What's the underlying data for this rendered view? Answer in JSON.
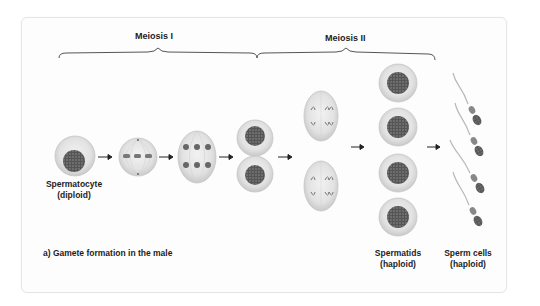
{
  "diagram": {
    "title": "a) Gamete formation in the male",
    "phases": [
      {
        "label": "Meiosis I"
      },
      {
        "label": "Meiosis II"
      }
    ],
    "stages": [
      {
        "name": "Spermatocyte",
        "ploidy": "(diploid)"
      },
      {
        "name": "Metaphase I"
      },
      {
        "name": "Anaphase I"
      },
      {
        "name": "Telophase I / two daughter cells"
      },
      {
        "name": "Anaphase II (two cells)"
      },
      {
        "name": "Spermatids",
        "ploidy": "(haploid)"
      },
      {
        "name": "Sperm cells",
        "ploidy": "(haploid)"
      }
    ],
    "colors": {
      "cell_fill": "#e4e4e4",
      "cell_edge": "#c8c8c8",
      "nucleus": "#5a5a5a",
      "arrow": "#222222",
      "text": "#1e1e1e",
      "card_border": "#e6e6e6"
    }
  }
}
